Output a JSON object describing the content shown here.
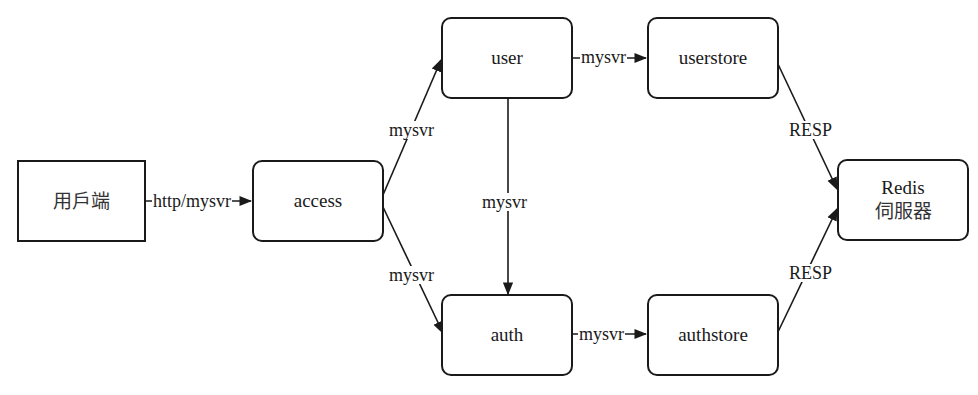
{
  "diagram": {
    "type": "architecture-flow",
    "colors": {
      "stroke": "#1a1a1a",
      "background": "#ffffff",
      "text": "#1a1a1a"
    },
    "nodes": {
      "client": {
        "label": "用戶端",
        "shape": "square"
      },
      "access": {
        "label": "access",
        "shape": "rounded"
      },
      "user": {
        "label": "user",
        "shape": "rounded"
      },
      "userstore": {
        "label": "userstore",
        "shape": "rounded"
      },
      "auth": {
        "label": "auth",
        "shape": "rounded"
      },
      "authstore": {
        "label": "authstore",
        "shape": "rounded"
      },
      "redis": {
        "label_line1": "Redis",
        "label_line2": "伺服器",
        "shape": "rounded"
      }
    },
    "edges": {
      "client_access": {
        "from": "client",
        "to": "access",
        "label": "http/mysvr"
      },
      "access_user": {
        "from": "access",
        "to": "user",
        "label": "mysvr"
      },
      "access_auth": {
        "from": "access",
        "to": "auth",
        "label": "mysvr"
      },
      "user_auth": {
        "from": "user",
        "to": "auth",
        "label": "mysvr"
      },
      "user_userstore": {
        "from": "user",
        "to": "userstore",
        "label": "mysvr"
      },
      "auth_authstore": {
        "from": "auth",
        "to": "authstore",
        "label": "mysvr"
      },
      "userstore_redis": {
        "from": "userstore",
        "to": "redis",
        "label": "RESP"
      },
      "authstore_redis": {
        "from": "authstore",
        "to": "redis",
        "label": "RESP"
      }
    }
  }
}
